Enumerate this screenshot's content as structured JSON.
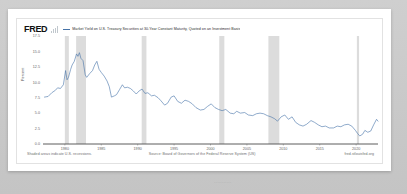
{
  "page": {
    "background_color": "#c9c9c9",
    "card_background": "#ffffff"
  },
  "chart_header": {
    "logo_text": "FRED",
    "logo_icon": "bar-chart-icon",
    "legend_dash": "—",
    "legend_label": "Market Yield on U.S. Treasury Securities at 30-Year Constant Maturity, Quoted on an Investment Basis",
    "legend_color": "#4572a7"
  },
  "footer": {
    "recession_note": "Shaded areas indicate U.S. recessions.",
    "source": "Source: Board of Governors of the Federal Reserve System (US)",
    "url": "fred.stlouisfed.org"
  },
  "bottom_strip": {
    "text": "..........."
  },
  "chart_data": {
    "type": "line",
    "title": "Market Yield on U.S. Treasury Securities at 30-Year Constant Maturity, Quoted on an Investment Basis",
    "xlabel": "",
    "ylabel": "Percent",
    "grid": false,
    "legend_position": "top",
    "line_color": "#4572a7",
    "axis_color": "#4a4a4a",
    "recession_band_color": "#dcdcdc",
    "xlim": [
      1977,
      2023
    ],
    "ylim": [
      0,
      17.5
    ],
    "yticks": [
      0.0,
      2.5,
      5.0,
      7.5,
      10.0,
      12.5,
      15.0,
      17.5
    ],
    "ytick_labels": [
      "0.0",
      "2.5",
      "5.0",
      "7.5",
      "10.0",
      "12.5",
      "15.0",
      "17.5"
    ],
    "xticks": [
      1980,
      1985,
      1990,
      1995,
      2000,
      2005,
      2010,
      2015,
      2020
    ],
    "xtick_labels": [
      "1980",
      "1985",
      "1990",
      "1995",
      "2000",
      "2005",
      "2010",
      "2015",
      "2020"
    ],
    "recessions": [
      {
        "start": 1980.0,
        "end": 1980.55
      },
      {
        "start": 1981.55,
        "end": 1982.9
      },
      {
        "start": 1990.55,
        "end": 1991.2
      },
      {
        "start": 2001.2,
        "end": 2001.9
      },
      {
        "start": 2007.95,
        "end": 2009.45
      },
      {
        "start": 2020.1,
        "end": 2020.4
      }
    ],
    "series": [
      {
        "name": "30-Year Treasury Constant Maturity Rate",
        "x": [
          1977.2,
          1977.7,
          1978.2,
          1978.7,
          1979.0,
          1979.4,
          1979.8,
          1980.1,
          1980.3,
          1980.5,
          1980.8,
          1981.0,
          1981.3,
          1981.6,
          1981.8,
          1982.0,
          1982.2,
          1982.5,
          1982.8,
          1983.0,
          1983.4,
          1983.8,
          1984.1,
          1984.4,
          1984.7,
          1985.0,
          1985.4,
          1985.8,
          1986.1,
          1986.4,
          1986.8,
          1987.1,
          1987.5,
          1987.9,
          1988.2,
          1988.6,
          1989.0,
          1989.4,
          1989.8,
          1990.2,
          1990.6,
          1991.0,
          1991.4,
          1991.9,
          1992.3,
          1992.8,
          1993.2,
          1993.7,
          1994.1,
          1994.6,
          1995.0,
          1995.5,
          1996.0,
          1996.5,
          1997.0,
          1997.5,
          1998.0,
          1998.6,
          1999.1,
          1999.6,
          2000.1,
          2000.6,
          2001.1,
          2001.6,
          2002.1,
          2002.7,
          2003.2,
          2003.6,
          2004.1,
          2004.7,
          2005.2,
          2005.8,
          2006.3,
          2006.8,
          2007.3,
          2007.8,
          2008.3,
          2008.8,
          2009.2,
          2009.7,
          2010.2,
          2010.7,
          2011.2,
          2011.7,
          2012.2,
          2012.7,
          2013.2,
          2013.8,
          2014.3,
          2014.8,
          2015.3,
          2015.8,
          2016.3,
          2016.9,
          2017.4,
          2017.9,
          2018.4,
          2018.9,
          2019.4,
          2019.9,
          2020.2,
          2020.5,
          2020.9,
          2021.2,
          2021.6,
          2022.0,
          2022.4,
          2022.8,
          2023.0
        ],
        "y": [
          7.6,
          7.7,
          8.3,
          8.7,
          9.1,
          9.0,
          9.6,
          11.9,
          10.4,
          10.8,
          12.1,
          12.8,
          13.4,
          14.6,
          14.2,
          14.8,
          13.9,
          13.5,
          11.2,
          10.8,
          11.4,
          11.9,
          12.8,
          13.4,
          12.1,
          11.6,
          11.0,
          10.2,
          9.3,
          7.6,
          7.8,
          8.0,
          8.8,
          9.6,
          9.1,
          9.2,
          9.0,
          8.6,
          8.1,
          8.6,
          8.9,
          8.2,
          8.3,
          7.8,
          7.9,
          7.5,
          7.0,
          6.3,
          6.6,
          7.6,
          7.8,
          6.9,
          6.6,
          7.1,
          6.9,
          6.5,
          5.9,
          5.5,
          5.6,
          6.1,
          6.5,
          5.9,
          5.6,
          5.4,
          5.6,
          5.0,
          4.9,
          5.3,
          5.0,
          5.1,
          4.7,
          4.6,
          4.9,
          5.0,
          4.9,
          4.6,
          4.4,
          4.1,
          3.7,
          4.4,
          4.7,
          4.0,
          4.4,
          3.5,
          3.1,
          2.9,
          3.2,
          3.8,
          3.5,
          3.1,
          2.8,
          2.9,
          2.6,
          2.6,
          2.9,
          2.8,
          3.1,
          3.2,
          2.9,
          2.2,
          1.7,
          1.3,
          1.6,
          2.2,
          1.9,
          2.1,
          3.1,
          4.0,
          3.7
        ]
      }
    ]
  }
}
